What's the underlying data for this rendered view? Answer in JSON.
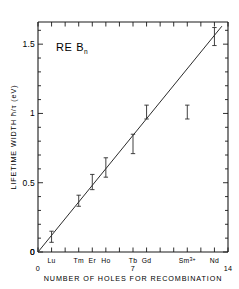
{
  "chart_data": {
    "type": "scatter",
    "title": "",
    "annotation": "RE B",
    "annotation_subscript": "n",
    "xlabel": "NUMBER OF HOLES FOR RECOMBINATION",
    "ylabel": "LIFETIME WIDTH ħ/τ (eV)",
    "xlim": [
      0,
      14
    ],
    "ylim": [
      0,
      1.66
    ],
    "xticks": [
      0,
      1,
      2,
      3,
      4,
      5,
      6,
      7,
      8,
      9,
      10,
      11,
      12,
      13,
      14
    ],
    "xtick_labels": [
      "0",
      "",
      "",
      "",
      "",
      "",
      "",
      "7",
      "",
      "",
      "",
      "",
      "",
      "",
      "14"
    ],
    "yticks": [
      0,
      0.1,
      0.2,
      0.3,
      0.4,
      0.5,
      0.6,
      0.7,
      0.8,
      0.9,
      1.0,
      1.1,
      1.2,
      1.3,
      1.4,
      1.5,
      1.6
    ],
    "ytick_labels": [
      "0",
      "",
      "",
      "",
      "",
      "0.5",
      "",
      "",
      "",
      "",
      "1",
      "",
      "",
      "",
      "",
      "1.5",
      ""
    ],
    "grid": false,
    "legend": "none",
    "element_labels": [
      {
        "name": "Lu",
        "x": 1
      },
      {
        "name": "Tm",
        "x": 3
      },
      {
        "name": "Er",
        "x": 4
      },
      {
        "name": "Ho",
        "x": 5
      },
      {
        "name": "Tb",
        "x": 7
      },
      {
        "name": "Gd",
        "x": 8
      },
      {
        "name": "Sm",
        "superscript": "3+",
        "x": 11
      },
      {
        "name": "Nd",
        "x": 13
      }
    ],
    "points": [
      {
        "label": "Lu",
        "x": 1,
        "y": 0.11,
        "yerr_low": 0.07,
        "yerr_high": 0.15
      },
      {
        "label": "Tm",
        "x": 3,
        "y": 0.37,
        "yerr_low": 0.33,
        "yerr_high": 0.41
      },
      {
        "label": "Er",
        "x": 4,
        "y": 0.51,
        "yerr_low": 0.45,
        "yerr_high": 0.56
      },
      {
        "label": "Ho",
        "x": 5,
        "y": 0.61,
        "yerr_low": 0.54,
        "yerr_high": 0.68
      },
      {
        "label": "Tb",
        "x": 7,
        "y": 0.78,
        "yerr_low": 0.71,
        "yerr_high": 0.85
      },
      {
        "label": "Gd",
        "x": 8,
        "y": 1.01,
        "yerr_low": 0.96,
        "yerr_high": 1.06
      },
      {
        "label": "Sm3+",
        "x": 11,
        "y": 1.01,
        "yerr_low": 0.96,
        "yerr_high": 1.06
      },
      {
        "label": "Nd",
        "x": 13,
        "y": 1.55,
        "yerr_low": 1.49,
        "yerr_high": 1.62
      }
    ],
    "fit_line": {
      "x0": 0,
      "y0": 0.0,
      "x1": 13.55,
      "y1": 1.63,
      "slope": 0.1203,
      "intercept": 0.0
    }
  }
}
